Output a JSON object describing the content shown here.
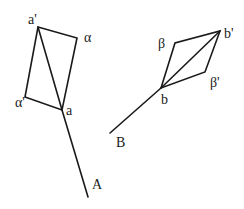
{
  "diagram": {
    "background": "#ffffff",
    "stroke_color": "#1a1a1a",
    "figure_a": {
      "points": {
        "a_prime": [
          38,
          27
        ],
        "alpha": [
          77,
          38
        ],
        "a": [
          62,
          110
        ],
        "alpha_prime": [
          25,
          97
        ],
        "A_end": [
          88,
          197
        ]
      },
      "labels": {
        "a_prime": "a'",
        "alpha": "α",
        "a": "a",
        "alpha_prime": "α'",
        "A": "A"
      }
    },
    "figure_b": {
      "points": {
        "b": [
          161,
          88
        ],
        "beta": [
          175,
          43
        ],
        "b_prime": [
          220,
          31
        ],
        "beta_prime": [
          205,
          72
        ],
        "B_end": [
          110,
          133
        ]
      },
      "labels": {
        "b": "b",
        "beta": "β",
        "b_prime": "b'",
        "beta_prime": "β'",
        "B": "B"
      }
    }
  }
}
